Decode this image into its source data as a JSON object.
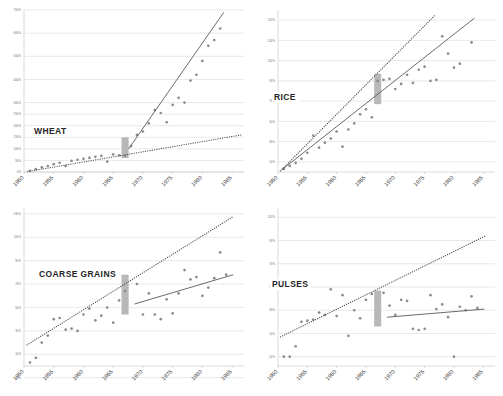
{
  "figure": {
    "width": 503,
    "height": 396,
    "background": "#ffffff",
    "panel_count": 4,
    "colors": {
      "point": "#8c8c8c",
      "trend_solid": "#5a5a5a",
      "trend_dotted": "#4d4d4d",
      "grid": "#d3d3d3",
      "marker_bar": "#b8b8b8",
      "title_text": "#262626",
      "tick_text": "#3d3d3d"
    }
  },
  "chart_data": [
    {
      "type": "scatter",
      "title": "WHEAT",
      "xlabel": "",
      "ylabel": "",
      "grid": true,
      "legend": "none",
      "xlim": [
        1950,
        1987
      ],
      "ylim": [
        0,
        700
      ],
      "xticks": [
        "1950",
        "1955",
        "1960",
        "1965",
        "1970",
        "1975",
        "1980",
        "1985"
      ],
      "xtick_values": [
        1950,
        1955,
        1960,
        1965,
        1970,
        1975,
        1980,
        1985
      ],
      "yticks": [
        "0%",
        "50%",
        "100%",
        "150%",
        "200%",
        "250%",
        "300%",
        "400%",
        "500%",
        "600%",
        "700%"
      ],
      "ytick_values": [
        0,
        50,
        100,
        150,
        200,
        250,
        300,
        400,
        500,
        600,
        700
      ],
      "marker_band": {
        "label": "1967",
        "x_start": 1966.4,
        "x_end": 1967.6,
        "y_low": 60,
        "y_high": 150
      },
      "series": [
        {
          "name": "observations",
          "style": "points",
          "x": [
            1951,
            1952,
            1953,
            1954,
            1955,
            1956,
            1957,
            1958,
            1959,
            1960,
            1961,
            1962,
            1963,
            1964,
            1965,
            1966,
            1967,
            1968,
            1969,
            1970,
            1971,
            1972,
            1973,
            1974,
            1975,
            1976,
            1977,
            1978,
            1979,
            1980,
            1981,
            1982,
            1983
          ],
          "y": [
            5,
            12,
            20,
            26,
            34,
            40,
            26,
            48,
            53,
            57,
            61,
            66,
            70,
            45,
            76,
            72,
            70,
            112,
            160,
            175,
            210,
            268,
            255,
            215,
            290,
            320,
            300,
            395,
            420,
            480,
            545,
            570,
            620
          ]
        },
        {
          "name": "pre-1967 trend",
          "style": "dotted-line",
          "x": [
            1950.6,
            1986.5
          ],
          "y": [
            2,
            160
          ]
        },
        {
          "name": "post-1967 trend",
          "style": "solid-line",
          "x": [
            1967.6,
            1983.6
          ],
          "y": [
            100,
            690
          ]
        }
      ]
    },
    {
      "type": "scatter",
      "title": "RICE",
      "xlabel": "",
      "ylabel": "",
      "grid": true,
      "legend": "none",
      "xlim": [
        1950,
        1987
      ],
      "ylim": [
        0,
        160
      ],
      "xticks": [
        "1950",
        "1955",
        "1960",
        "1965",
        "1970",
        "1975",
        "1980",
        "1985"
      ],
      "xtick_values": [
        1950,
        1955,
        1960,
        1965,
        1970,
        1975,
        1980,
        1985
      ],
      "yticks": [
        "10%",
        "30%",
        "50%",
        "70%",
        "90%",
        "110%",
        "130%",
        "150%"
      ],
      "ytick_values": [
        10,
        30,
        50,
        70,
        90,
        110,
        130,
        150
      ],
      "marker_band": {
        "label": "1967",
        "x_start": 1966.4,
        "x_end": 1967.6,
        "y_low": 67,
        "y_high": 97
      },
      "series": [
        {
          "name": "observations",
          "style": "points",
          "x": [
            1951,
            1952,
            1953,
            1954,
            1955,
            1956,
            1957,
            1958,
            1959,
            1960,
            1961,
            1962,
            1963,
            1964,
            1965,
            1966,
            1967,
            1968,
            1969,
            1970,
            1971,
            1972,
            1973,
            1974,
            1975,
            1976,
            1977,
            1978,
            1979,
            1980,
            1981,
            1983
          ],
          "y": [
            3,
            6,
            9,
            13,
            19,
            36,
            24,
            29,
            33,
            40,
            25,
            42,
            48,
            57,
            62,
            54,
            90,
            91,
            92,
            82,
            87,
            96,
            88,
            101,
            104,
            90,
            91,
            134,
            117,
            103,
            107,
            128
          ]
        },
        {
          "name": "pre-1967 trend",
          "style": "dotted-line",
          "x": [
            1950.4,
            1976.8
          ],
          "y": [
            1,
            155
          ]
        },
        {
          "name": "post-1967 trend",
          "style": "solid-line",
          "x": [
            1950.6,
            1983.5
          ],
          "y": [
            2,
            152
          ]
        }
      ]
    },
    {
      "type": "scatter",
      "title": "COARSE GRAINS",
      "xlabel": "",
      "ylabel": "",
      "grid": true,
      "legend": "none",
      "xlim": [
        1950,
        1987
      ],
      "ylim": [
        0,
        135
      ],
      "xticks": [
        "1950",
        "1955",
        "1960",
        "1965",
        "1970",
        "1975",
        "1980",
        "1985"
      ],
      "xtick_values": [
        1950,
        1955,
        1960,
        1965,
        1970,
        1975,
        1980,
        1985
      ],
      "yticks": [
        "-10%",
        "10%",
        "30%",
        "50%",
        "70%",
        "90%",
        "110%",
        "130%"
      ],
      "ytick_values": [
        -10,
        10,
        30,
        50,
        70,
        90,
        110,
        130
      ],
      "marker_band": {
        "label": "1967",
        "x_start": 1966.4,
        "x_end": 1967.6,
        "y_low": 44,
        "y_high": 78
      },
      "series": [
        {
          "name": "observations",
          "style": "points",
          "x": [
            1951,
            1952,
            1953,
            1954,
            1955,
            1956,
            1957,
            1958,
            1959,
            1960,
            1961,
            1962,
            1963,
            1964,
            1965,
            1966,
            1967,
            1969,
            1970,
            1971,
            1972,
            1973,
            1974,
            1975,
            1976,
            1977,
            1978,
            1979,
            1980,
            1981,
            1982,
            1983,
            1984
          ],
          "y": [
            3,
            7,
            20,
            26,
            40,
            41,
            31,
            32,
            30,
            44,
            49,
            39,
            43,
            50,
            37,
            56,
            64,
            70,
            44,
            62,
            44,
            40,
            57,
            45,
            62,
            82,
            74,
            76,
            60,
            67,
            75,
            97,
            78
          ]
        },
        {
          "name": "pre-1967 trend",
          "style": "dotted-line",
          "x": [
            1950.5,
            1985.3
          ],
          "y": [
            18,
            128
          ]
        },
        {
          "name": "post-1967 trend",
          "style": "solid-line",
          "x": [
            1968.6,
            1985.2
          ],
          "y": [
            53,
            78
          ]
        }
      ]
    },
    {
      "type": "scatter",
      "title": "PULSES",
      "xlabel": "",
      "ylabel": "",
      "grid": true,
      "legend": "none",
      "xlim": [
        1950,
        1987
      ],
      "ylim": [
        -18,
        118
      ],
      "xticks": [
        "1950",
        "1955",
        "1960",
        "1965",
        "1970",
        "1975",
        "1980",
        "1985"
      ],
      "xtick_values": [
        1950,
        1955,
        1960,
        1965,
        1970,
        1975,
        1980,
        1985
      ],
      "yticks": [
        "-10%",
        "10%",
        "30%",
        "50%",
        "70%",
        "90%",
        "110%"
      ],
      "ytick_values": [
        -10,
        10,
        30,
        50,
        70,
        90,
        110
      ],
      "marker_band": {
        "label": "1967",
        "x_start": 1966.4,
        "x_end": 1967.6,
        "y_low": 16,
        "y_high": 47
      },
      "series": [
        {
          "name": "observations",
          "style": "points",
          "x": [
            1951,
            1952,
            1953,
            1954,
            1955,
            1956,
            1957,
            1958,
            1959,
            1960,
            1961,
            1962,
            1963,
            1964,
            1965,
            1966,
            1968,
            1969,
            1970,
            1971,
            1972,
            1973,
            1974,
            1975,
            1976,
            1977,
            1978,
            1979,
            1980,
            1981,
            1982,
            1983,
            1984
          ],
          "y": [
            -10,
            -10,
            -1,
            20,
            21,
            22,
            28,
            26,
            48,
            25,
            43,
            8,
            30,
            23,
            39,
            44,
            45,
            34,
            26,
            39,
            38,
            14,
            13,
            14,
            43,
            31,
            35,
            24,
            -10,
            33,
            30,
            42,
            32
          ]
        },
        {
          "name": "pre-1967 trend",
          "style": "dotted-line",
          "x": [
            1950.4,
            1985.4
          ],
          "y": [
            7,
            94
          ]
        },
        {
          "name": "post-1967 trend",
          "style": "solid-line",
          "x": [
            1968.6,
            1985.2
          ],
          "y": [
            24,
            31
          ]
        }
      ]
    }
  ]
}
